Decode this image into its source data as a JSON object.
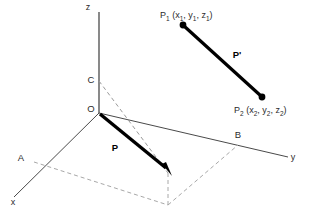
{
  "figure": {
    "type": "3d-vector-diagram",
    "axes": {
      "z_label": "z",
      "x_label": "x",
      "y_label": "y"
    },
    "points": {
      "origin": "O",
      "c": "C",
      "a": "A",
      "b": "B"
    },
    "vectors": {
      "position_vector": "P",
      "displacement_vector": "P'"
    },
    "p1": {
      "name": "P",
      "sub": "1",
      "open_paren": " (x",
      "sub_x": "1",
      "comma_1": ", y",
      "sub_y": "1",
      "comma_2": ", z",
      "sub_z": "1",
      "close_paren": ")"
    },
    "p2": {
      "name": "P",
      "sub": "2",
      "open_paren": " (x",
      "sub_x": "2",
      "comma_1": ", y",
      "sub_y": "2",
      "comma_2": ", z",
      "sub_z": "2",
      "close_paren": ")"
    },
    "colors": {
      "axis": "#4a4a4a",
      "dashed": "#a8a8a8",
      "vector": "#000000",
      "background": "#ffffff",
      "text": "#2b2b2b"
    }
  }
}
